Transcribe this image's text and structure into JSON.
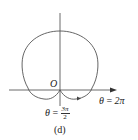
{
  "figure": {
    "caption": "(d)",
    "origin_label": "O",
    "labels": {
      "theta_2pi": {
        "var": "θ",
        "eq": "=",
        "value": "2π"
      },
      "theta_3pi_2": {
        "var": "θ",
        "eq": "=",
        "num": "3π",
        "den": "2"
      }
    },
    "colors": {
      "curve": "#555555",
      "axis": "#444444",
      "text": "#222222"
    }
  }
}
